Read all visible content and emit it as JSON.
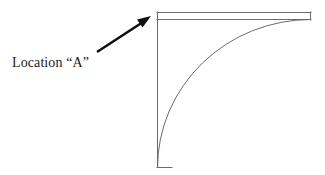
{
  "figure": {
    "background_color": "#ffffff",
    "width": 325,
    "height": 175,
    "label": {
      "text": "Location “A”",
      "color": "#1a1a1a",
      "font_size_px": 14,
      "x": 12,
      "y": 54
    },
    "arrow": {
      "name": "leader-arrow",
      "color": "#111111",
      "stroke_width": 2.6,
      "tail_x": 97,
      "tail_y": 52,
      "tip_x": 151,
      "tip_y": 16,
      "head_style": "solid-triangle"
    },
    "shape": {
      "name": "quarter-round-outline",
      "stroke_color": "#6b6b6b",
      "stroke_width": 1,
      "fill": "none",
      "left_edge_x": 157,
      "right_edge_x": 311,
      "top_y": 12,
      "bottom_y": 167,
      "strip_top_y": 12,
      "strip_bottom_y": 19,
      "arc_start_x": 311,
      "arc_start_y": 19,
      "arc_end_x": 157,
      "arc_end_y": 167,
      "arc_radius": 150,
      "description": "Rectangular panel with a narrow horizontal band across the top and a quarter-circle arc sweeping from the upper right down to the lower left corner"
    }
  }
}
